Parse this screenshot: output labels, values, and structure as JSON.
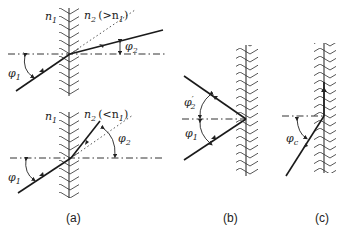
{
  "figure": {
    "panels": [
      {
        "id": "a-top",
        "labels": {
          "medium1": "n",
          "medium1_sub": "1",
          "medium2": "n",
          "medium2_sub": "2",
          "medium2_cond": "(>n",
          "medium2_cond_sub": "1",
          "medium2_cond_end": ")",
          "angle_in": "φ",
          "angle_in_sub": "1",
          "angle_out": "φ",
          "angle_out_sub": "2"
        }
      },
      {
        "id": "a-bottom",
        "labels": {
          "medium1": "n",
          "medium1_sub": "1",
          "medium2": "n",
          "medium2_sub": "2",
          "medium2_cond": "(<n",
          "medium2_cond_sub": "1",
          "medium2_cond_end": ")",
          "angle_in": "φ",
          "angle_in_sub": "1",
          "angle_out": "φ",
          "angle_out_sub": "2"
        }
      },
      {
        "id": "b",
        "labels": {
          "angle_reflect": "φ",
          "angle_reflect_sub": "2",
          "angle_reflect_prime": "′",
          "angle_in": "φ",
          "angle_in_sub": "1"
        }
      },
      {
        "id": "c",
        "labels": {
          "angle_critical": "φ",
          "angle_critical_sub": "c"
        }
      }
    ],
    "captions": {
      "a": "(a)",
      "b": "(b)",
      "c": "(c)"
    }
  }
}
